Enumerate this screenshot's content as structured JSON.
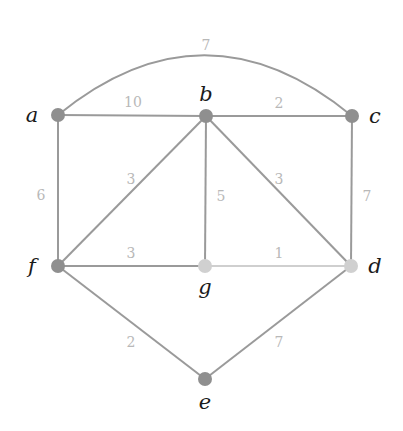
{
  "graph": {
    "colors": {
      "edge_dark": "#9a9a9a",
      "edge_light": "#cfcfcf",
      "node_dark": "#8f8f8f",
      "node_light": "#d0d0d0",
      "weight_label": "#b8b8b8",
      "node_label": "#1a1a1a"
    },
    "nodes": [
      {
        "id": "a",
        "label": "a",
        "x": 58,
        "y": 115,
        "shade": "dark",
        "lx": 32,
        "ly": 122
      },
      {
        "id": "b",
        "label": "b",
        "x": 206,
        "y": 116,
        "shade": "dark",
        "lx": 206,
        "ly": 101
      },
      {
        "id": "c",
        "label": "c",
        "x": 352,
        "y": 116,
        "shade": "dark",
        "lx": 375,
        "ly": 123
      },
      {
        "id": "d",
        "label": "d",
        "x": 351,
        "y": 266,
        "shade": "light",
        "lx": 375,
        "ly": 273
      },
      {
        "id": "e",
        "label": "e",
        "x": 205,
        "y": 379,
        "shade": "dark",
        "lx": 205,
        "ly": 409
      },
      {
        "id": "f",
        "label": "f",
        "x": 58,
        "y": 266,
        "shade": "dark",
        "lx": 32,
        "ly": 273
      },
      {
        "id": "g",
        "label": "g",
        "x": 205,
        "y": 266,
        "shade": "light",
        "lx": 205,
        "ly": 294
      }
    ],
    "edges": [
      {
        "from": "a",
        "to": "c",
        "weight": "7",
        "curved": true,
        "shade": "dark",
        "wx": 206,
        "wy": 46
      },
      {
        "from": "a",
        "to": "b",
        "weight": "10",
        "shade": "dark",
        "wx": 133,
        "wy": 103
      },
      {
        "from": "b",
        "to": "c",
        "weight": "2",
        "shade": "dark",
        "wx": 279,
        "wy": 104
      },
      {
        "from": "a",
        "to": "f",
        "weight": "6",
        "shade": "dark",
        "wx": 41,
        "wy": 196
      },
      {
        "from": "b",
        "to": "f",
        "weight": "3",
        "shade": "dark",
        "wx": 131,
        "wy": 180
      },
      {
        "from": "b",
        "to": "g",
        "weight": "5",
        "shade": "dark",
        "wx": 221,
        "wy": 197
      },
      {
        "from": "b",
        "to": "d",
        "weight": "3",
        "shade": "dark",
        "wx": 279,
        "wy": 180
      },
      {
        "from": "c",
        "to": "d",
        "weight": "7",
        "shade": "dark",
        "wx": 367,
        "wy": 197
      },
      {
        "from": "f",
        "to": "g",
        "weight": "3",
        "shade": "dark",
        "wx": 131,
        "wy": 254
      },
      {
        "from": "g",
        "to": "d",
        "weight": "1",
        "shade": "light",
        "wx": 279,
        "wy": 254
      },
      {
        "from": "f",
        "to": "e",
        "weight": "2",
        "shade": "dark",
        "wx": 131,
        "wy": 343
      },
      {
        "from": "d",
        "to": "e",
        "weight": "7",
        "shade": "dark",
        "wx": 279,
        "wy": 343
      }
    ]
  }
}
